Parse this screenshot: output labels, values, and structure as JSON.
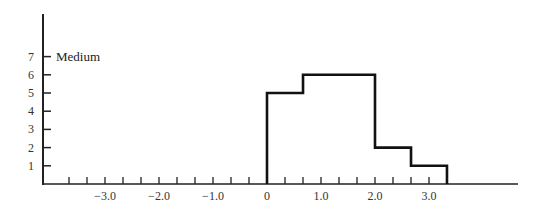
{
  "chart_data": {
    "type": "bar",
    "subtype": "step-histogram",
    "title": "",
    "xlabel": "",
    "ylabel": "",
    "annotation": "Medium",
    "bins": [
      {
        "x_start": 0.0,
        "x_end": 0.667,
        "value": 5
      },
      {
        "x_start": 0.667,
        "x_end": 2.0,
        "value": 6
      },
      {
        "x_start": 2.0,
        "x_end": 2.667,
        "value": 2
      },
      {
        "x_start": 2.667,
        "x_end": 3.333,
        "value": 1
      }
    ],
    "x_tick_labels": [
      "−3.0",
      "−2.0",
      "−1.0",
      "0",
      "1.0",
      "2.0",
      "3.0"
    ],
    "x_tick_values": [
      -3.0,
      -2.0,
      -1.0,
      0,
      1.0,
      2.0,
      3.0
    ],
    "x_minor_tick_step": 0.333,
    "y_tick_labels": [
      "1",
      "2",
      "3",
      "4",
      "5",
      "6",
      "7"
    ],
    "xlim": [
      -4.0,
      4.6
    ],
    "ylim": [
      0,
      8
    ],
    "grid": false,
    "legend": null
  }
}
